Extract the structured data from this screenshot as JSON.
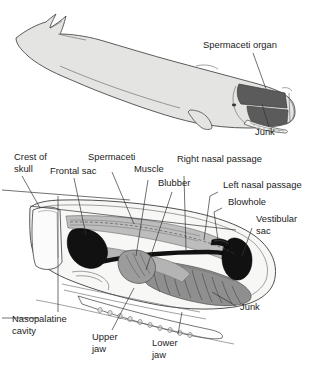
{
  "figure": {
    "panels": [
      {
        "id": "whale-body",
        "name": "whole-whale-lateral-view",
        "labels": [
          {
            "key": "spermaceti_organ",
            "text": "Spermaceti organ"
          },
          {
            "key": "junk_top",
            "text": "Junk"
          }
        ]
      },
      {
        "id": "head-section",
        "name": "head-cross-section",
        "labels": [
          {
            "key": "crest_of_skull",
            "text": "Crest of"
          },
          {
            "key": "crest_of_skull_2",
            "text": "skull"
          },
          {
            "key": "frontal_sac",
            "text": "Frontal sac"
          },
          {
            "key": "spermaceti",
            "text": "Spermaceti"
          },
          {
            "key": "muscle",
            "text": "Muscle"
          },
          {
            "key": "blubber",
            "text": "Blubber"
          },
          {
            "key": "right_nasal_passage",
            "text": "Right nasal passage"
          },
          {
            "key": "left_nasal_passage",
            "text": "Left nasal passage"
          },
          {
            "key": "blowhole",
            "text": "Blowhole"
          },
          {
            "key": "vestibular_sac",
            "text": "Vestibular"
          },
          {
            "key": "vestibular_sac_2",
            "text": "sac"
          },
          {
            "key": "junk_bottom",
            "text": "Junk"
          },
          {
            "key": "nasopalatine_cavity",
            "text": "Nasopalatine"
          },
          {
            "key": "nasopalatine_cavity_2",
            "text": "cavity"
          },
          {
            "key": "upper_jaw",
            "text": "Upper"
          },
          {
            "key": "upper_jaw_2",
            "text": "jaw"
          },
          {
            "key": "lower_jaw",
            "text": "Lower"
          },
          {
            "key": "lower_jaw_2",
            "text": "jaw"
          }
        ]
      }
    ],
    "colors": {
      "body_fill": "#e4e4e2",
      "outline": "#4a4a4a",
      "dark_organ": "#5b5b5b",
      "black_sac": "#111111",
      "mid_gray": "#a8a8a8",
      "light_gray": "#cfcfcf",
      "text": "#1c1c1c",
      "background": "#ffffff"
    }
  }
}
